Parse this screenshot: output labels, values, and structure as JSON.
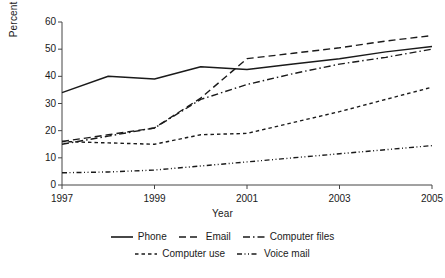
{
  "chart_data": {
    "type": "line",
    "title": "",
    "xlabel": "Year",
    "ylabel": "Percent \"yes\"",
    "x": [
      1997,
      1998,
      1999,
      2000,
      2001,
      2002,
      2003,
      2004,
      2005
    ],
    "xticks": [
      "1997",
      "1999",
      "2001",
      "2003",
      "2005"
    ],
    "xtick_values": [
      1997,
      1999,
      2001,
      2003,
      2005
    ],
    "yticks": [
      "0",
      "10",
      "20",
      "30",
      "40",
      "50",
      "60"
    ],
    "ytick_values": [
      0,
      10,
      20,
      30,
      40,
      50,
      60
    ],
    "xlim": [
      1997,
      2005
    ],
    "ylim": [
      0,
      60
    ],
    "grid": false,
    "legend_position": "bottom",
    "series": [
      {
        "name": "Phone",
        "dash": "solid",
        "color": "#1a1a1a",
        "values": [
          34,
          40,
          39,
          43.5,
          42.5,
          44.5,
          46.5,
          49,
          51
        ]
      },
      {
        "name": "Email",
        "dash": "dashed",
        "color": "#1a1a1a",
        "values": [
          16,
          18.5,
          21,
          32,
          46.5,
          48.5,
          50.5,
          53,
          55
        ]
      },
      {
        "name": "Computer files",
        "dash": "dash-dot",
        "color": "#1a1a1a",
        "values": [
          15,
          18,
          21,
          31.5,
          37,
          41,
          44.5,
          47,
          50
        ]
      },
      {
        "name": "Computer use",
        "dash": "short-dash",
        "color": "#1a1a1a",
        "values": [
          16,
          15.5,
          15,
          18.5,
          19,
          23,
          27,
          31.5,
          36
        ]
      },
      {
        "name": "Voice mail",
        "dash": "dash-dot-dot",
        "color": "#1a1a1a",
        "values": [
          4.5,
          4.8,
          5.5,
          7,
          8.5,
          10,
          11.5,
          13,
          14.5
        ]
      }
    ]
  },
  "legend": {
    "row1": [
      "Phone",
      "Email",
      "Computer files"
    ],
    "row2": [
      "Computer use",
      "Voice mail"
    ]
  }
}
